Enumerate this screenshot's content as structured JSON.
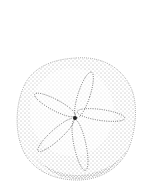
{
  "image": {
    "subject": "sand dollar illustration",
    "style": "stipple drawing",
    "colors": {
      "ink": "#3a3a3a",
      "background": "#ffffff"
    }
  }
}
